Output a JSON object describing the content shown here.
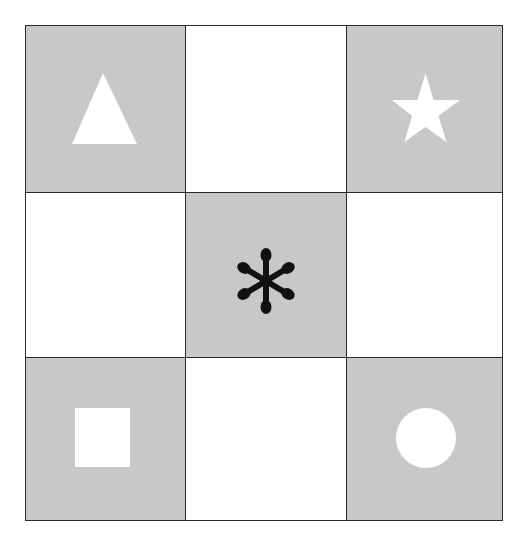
{
  "diagram": {
    "type": "3x3 grid of shapes",
    "colors": {
      "shaded_cell": "#c8c8c8",
      "empty_cell": "#ffffff",
      "grid_line": "#2a2a2a",
      "white_shape": "#ffffff",
      "black_shape": "#111111"
    },
    "cells": [
      {
        "row": 0,
        "col": 0,
        "shaded": true,
        "shape": "triangle-icon",
        "shape_color": "white"
      },
      {
        "row": 0,
        "col": 1,
        "shaded": false,
        "shape": null
      },
      {
        "row": 0,
        "col": 2,
        "shaded": true,
        "shape": "star-icon",
        "shape_color": "white"
      },
      {
        "row": 1,
        "col": 0,
        "shaded": false,
        "shape": null
      },
      {
        "row": 1,
        "col": 1,
        "shaded": true,
        "shape": "asterisk-icon",
        "shape_color": "black"
      },
      {
        "row": 1,
        "col": 2,
        "shaded": false,
        "shape": null
      },
      {
        "row": 2,
        "col": 0,
        "shaded": true,
        "shape": "square-icon",
        "shape_color": "white"
      },
      {
        "row": 2,
        "col": 1,
        "shaded": false,
        "shape": null
      },
      {
        "row": 2,
        "col": 2,
        "shaded": true,
        "shape": "circle-icon",
        "shape_color": "white"
      }
    ]
  }
}
